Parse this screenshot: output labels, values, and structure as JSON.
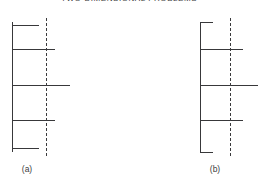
{
  "figure": {
    "title": "TWO-DIMENSIONAL PROBLEMS",
    "background_color": "#ffffff",
    "stroke_color": "#38383a",
    "dashed_stroke_color": "#3a3a3c",
    "text_color": "#3c3c3c"
  },
  "panels": [
    {
      "id": "a",
      "label": "(a)",
      "label_x": 27,
      "label_y": 164,
      "axis": {
        "name": "solid-vertical-axis",
        "x": 12,
        "y_top": 22,
        "y_bottom": 152
      },
      "centerline": {
        "name": "dashed-centerline",
        "x": 46,
        "y_top": 18,
        "y_bottom": 156
      },
      "bars": [
        {
          "index": 1,
          "y": 25,
          "x_start": 12,
          "x_end": 39,
          "length": 27,
          "size": "short"
        },
        {
          "index": 2,
          "y": 49,
          "x_start": 12,
          "x_end": 55,
          "length": 43,
          "size": "medium"
        },
        {
          "index": 3,
          "y": 85,
          "x_start": 12,
          "x_end": 70,
          "length": 58,
          "size": "long"
        },
        {
          "index": 4,
          "y": 120,
          "x_start": 12,
          "x_end": 55,
          "length": 43,
          "size": "medium"
        },
        {
          "index": 5,
          "y": 148,
          "x_start": 12,
          "x_end": 39,
          "length": 27,
          "size": "short"
        }
      ]
    },
    {
      "id": "b",
      "label": "(b)",
      "label_x": 215,
      "label_y": 164,
      "axis": {
        "name": "solid-vertical-axis",
        "x": 200,
        "y_top": 22,
        "y_bottom": 152
      },
      "centerline": {
        "name": "dashed-centerline",
        "x": 230,
        "y_top": 18,
        "y_bottom": 156
      },
      "bars": [
        {
          "index": 1,
          "y": 22,
          "x_start": 200,
          "x_end": 213,
          "length": 13,
          "size": "short"
        },
        {
          "index": 2,
          "y": 49,
          "x_start": 200,
          "x_end": 243,
          "length": 43,
          "size": "medium"
        },
        {
          "index": 3,
          "y": 85,
          "x_start": 200,
          "x_end": 258,
          "length": 58,
          "size": "long"
        },
        {
          "index": 4,
          "y": 120,
          "x_start": 200,
          "x_end": 243,
          "length": 43,
          "size": "medium"
        },
        {
          "index": 5,
          "y": 152,
          "x_start": 200,
          "x_end": 213,
          "length": 13,
          "size": "short"
        }
      ]
    }
  ]
}
